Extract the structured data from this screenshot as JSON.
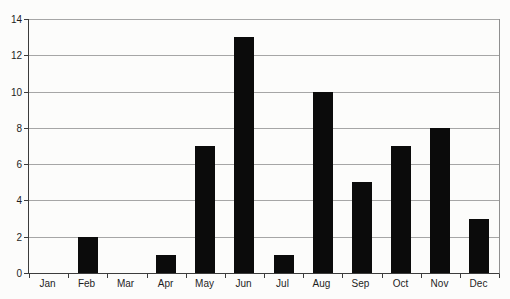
{
  "chart_data": {
    "type": "bar",
    "categories": [
      "Jan",
      "Feb",
      "Mar",
      "Apr",
      "May",
      "Jun",
      "Jul",
      "Aug",
      "Sep",
      "Oct",
      "Nov",
      "Dec"
    ],
    "values": [
      0,
      2,
      0,
      1,
      7,
      13,
      1,
      10,
      5,
      7,
      8,
      3
    ],
    "title": "",
    "xlabel": "",
    "ylabel": "",
    "ylim": [
      0,
      14
    ],
    "ytick_step": 2,
    "ytick_labels": [
      "0",
      "2",
      "4",
      "6",
      "8",
      "10",
      "12",
      "14"
    ],
    "grid": true,
    "legend": "none",
    "bar_color": "#0b0b0b",
    "grid_color": "#a6a6a6",
    "axis_color": "#3c3c3c",
    "text_color": "#1e1e1e",
    "background_color": "#fcfcfb"
  }
}
